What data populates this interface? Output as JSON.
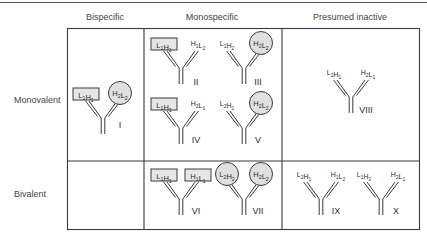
{
  "columns": [
    {
      "label": "Bispecific",
      "center_x": 105
    },
    {
      "label": "Monospecific",
      "center_x": 212
    },
    {
      "label": "Presumed inactive",
      "center_x": 350
    }
  ],
  "rows": [
    {
      "label": "Monovalent"
    },
    {
      "label": "Bivalent"
    }
  ],
  "colors": {
    "line": "#3a3a3a",
    "box_fill": "#e6e6e6",
    "circle_fill": "#e0e0e0"
  },
  "antibodies": [
    {
      "id": "I",
      "numeral": "I",
      "cell": "bispecific-monovalent",
      "left": {
        "label": "L1H1",
        "shape": "box"
      },
      "right": {
        "label": "H2L2",
        "shape": "circle"
      }
    },
    {
      "id": "II",
      "numeral": "II",
      "cell": "monospecific-monovalent",
      "left": {
        "label": "L1H1",
        "shape": "box"
      },
      "right": {
        "label": "H1L2",
        "shape": "none"
      }
    },
    {
      "id": "III",
      "numeral": "III",
      "cell": "monospecific-monovalent",
      "left": {
        "label": "L1H2",
        "shape": "none"
      },
      "right": {
        "label": "H2L2",
        "shape": "circle"
      }
    },
    {
      "id": "IV",
      "numeral": "IV",
      "cell": "monospecific-monovalent",
      "left": {
        "label": "L1H1",
        "shape": "box"
      },
      "right": {
        "label": "H2L1",
        "shape": "none"
      }
    },
    {
      "id": "V",
      "numeral": "V",
      "cell": "monospecific-monovalent",
      "left": {
        "label": "L2H1",
        "shape": "none"
      },
      "right": {
        "label": "H2L2",
        "shape": "circle"
      }
    },
    {
      "id": "VI",
      "numeral": "VI",
      "cell": "monospecific-bivalent",
      "left": {
        "label": "L1H1",
        "shape": "box"
      },
      "right": {
        "label": "H1L1",
        "shape": "box"
      }
    },
    {
      "id": "VII",
      "numeral": "VII",
      "cell": "monospecific-bivalent",
      "left": {
        "label": "L2H2",
        "shape": "circle"
      },
      "right": {
        "label": "H2L2",
        "shape": "circle"
      }
    },
    {
      "id": "VIII",
      "numeral": "VIII",
      "cell": "inactive-monovalent",
      "left": {
        "label": "L2H1",
        "shape": "none"
      },
      "right": {
        "label": "H2L1",
        "shape": "none"
      }
    },
    {
      "id": "IX",
      "numeral": "IX",
      "cell": "inactive-bivalent",
      "left": {
        "label": "L2H1",
        "shape": "none"
      },
      "right": {
        "label": "H1L2",
        "shape": "none"
      }
    },
    {
      "id": "X",
      "numeral": "X",
      "cell": "inactive-bivalent",
      "left": {
        "label": "L1H2",
        "shape": "none"
      },
      "right": {
        "label": "H2L1",
        "shape": "none"
      }
    }
  ]
}
